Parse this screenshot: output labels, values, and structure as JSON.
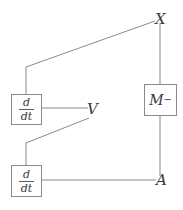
{
  "diagram": {
    "canvas": {
      "width": 183,
      "height": 210,
      "background": "#ffffff"
    },
    "stroke_color": "#8a8a8a",
    "text_color": "#3a3a3a",
    "nodes": [
      {
        "id": "X",
        "type": "terminal-label",
        "label": "X",
        "x": 155,
        "y": 12
      },
      {
        "id": "M-minus",
        "type": "operator-box",
        "label": "M",
        "superscript": "−",
        "box": {
          "x": 144,
          "y": 84,
          "width": 33,
          "height": 32
        }
      },
      {
        "id": "A",
        "type": "terminal-label",
        "label": "A",
        "x": 156,
        "y": 173
      },
      {
        "id": "V",
        "type": "terminal-label",
        "label": "V",
        "x": 87,
        "y": 102
      },
      {
        "id": "ddt-upper",
        "type": "derivative-box",
        "numerator": "d",
        "denominator": "dt",
        "box": {
          "x": 11,
          "y": 94,
          "width": 31,
          "height": 31
        }
      },
      {
        "id": "ddt-lower",
        "type": "derivative-box",
        "numerator": "d",
        "denominator": "dt",
        "box": {
          "x": 11,
          "y": 165,
          "width": 31,
          "height": 32
        }
      }
    ],
    "edges": [
      {
        "id": "edge-x-to-ddt-upper",
        "from": "X",
        "to": "ddt-upper",
        "points": "155,21 26,67 26,94"
      },
      {
        "id": "edge-x-to-m",
        "from": "X",
        "to": "M-minus",
        "points": "160,23 160,84"
      },
      {
        "id": "edge-m-to-a",
        "from": "M-minus",
        "to": "A",
        "points": "160,116 160,176"
      },
      {
        "id": "edge-ddt-upper-to-v",
        "from": "ddt-upper",
        "to": "V",
        "points": "42,108 88,108"
      },
      {
        "id": "edge-v-to-ddt-lower",
        "from": "V",
        "to": "ddt-lower",
        "points": "89,118 26,143 26,165"
      },
      {
        "id": "edge-ddt-lower-to-a",
        "from": "ddt-lower",
        "to": "A",
        "points": "42,180 156,180"
      }
    ]
  }
}
